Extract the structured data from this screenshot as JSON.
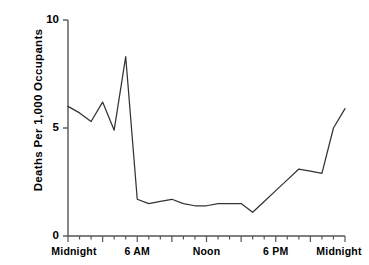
{
  "chart_data": {
    "type": "line",
    "title": "",
    "subtitle": "",
    "xlabel": "",
    "ylabel": "Deaths Per 1,000 Occupants",
    "ylim": [
      0,
      10
    ],
    "xlim": [
      0,
      24
    ],
    "grid": false,
    "legend": "none",
    "y_ticks": [
      {
        "value": 0,
        "label": "0"
      },
      {
        "value": 5,
        "label": "5"
      },
      {
        "value": 10,
        "label": "10"
      }
    ],
    "x_ticks": [
      {
        "value": 0,
        "label": "Midnight"
      },
      {
        "value": 6,
        "label": "6 AM"
      },
      {
        "value": 12,
        "label": "Noon"
      },
      {
        "value": 18,
        "label": "6 PM"
      },
      {
        "value": 24,
        "label": "Midnight"
      }
    ],
    "x_minor_tick_interval": 1,
    "x_major_tick_interval": 3,
    "x": [
      0,
      1,
      2,
      3,
      4,
      5,
      6,
      7,
      8,
      9,
      10,
      11,
      12,
      13,
      14,
      15,
      16,
      17,
      18,
      19,
      20,
      21,
      22,
      23,
      24
    ],
    "values": [
      6.0,
      5.7,
      5.3,
      6.2,
      4.9,
      8.3,
      1.7,
      1.5,
      1.6,
      1.7,
      1.5,
      1.4,
      1.4,
      1.5,
      1.5,
      1.5,
      1.1,
      1.6,
      2.1,
      2.6,
      3.1,
      3.0,
      2.9,
      5.0,
      5.9
    ],
    "series": [
      {
        "name": "Deaths Per 1,000 Occupants",
        "color": "#333333",
        "values": [
          6.0,
          5.7,
          5.3,
          6.2,
          4.9,
          8.3,
          1.7,
          1.5,
          1.6,
          1.7,
          1.5,
          1.4,
          1.4,
          1.5,
          1.5,
          1.5,
          1.1,
          1.6,
          2.1,
          2.6,
          3.1,
          3.0,
          2.9,
          5.0,
          5.9
        ]
      }
    ],
    "annotations": []
  },
  "plot": {
    "axis_color": "#555555",
    "line_color": "#333333",
    "background": "#ffffff"
  }
}
